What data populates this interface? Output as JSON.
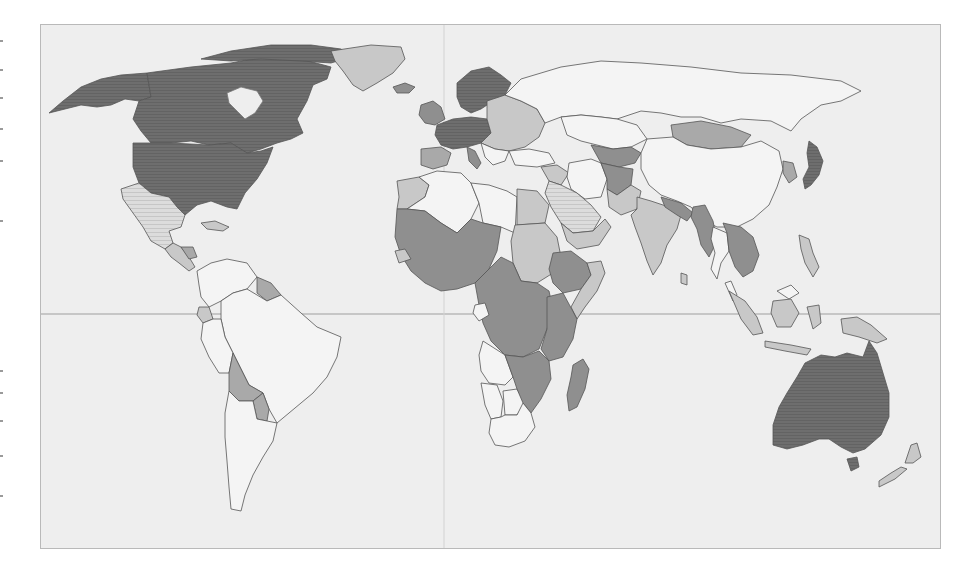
{
  "map": {
    "type": "choropleth",
    "projection": "world",
    "color_scheme": "grayscale",
    "background_ocean": "#eeeeee",
    "frame_border": "#b9b9b9",
    "border_color": "#555555",
    "graticule": {
      "equator": true,
      "prime_meridian": true,
      "line_color": "#9e9e9e"
    },
    "classes": [
      {
        "id": "c1",
        "fill": "#6e6e6e",
        "pattern": "fine-stripes",
        "description": "darkest"
      },
      {
        "id": "c2",
        "fill": "#8f8f8f",
        "pattern": "solid",
        "description": "dark"
      },
      {
        "id": "c3",
        "fill": "#a9a9a9",
        "pattern": "solid",
        "description": "medium"
      },
      {
        "id": "c4",
        "fill": "#c8c8c8",
        "pattern": "solid",
        "description": "light"
      },
      {
        "id": "c5",
        "fill": "#d9d9d9",
        "pattern": "hatched",
        "description": "light hatched"
      },
      {
        "id": "c6",
        "fill": "#f4f4f4",
        "pattern": "solid",
        "description": "lightest"
      }
    ],
    "regions": [
      {
        "name": "Canada",
        "class": "c1"
      },
      {
        "name": "United States",
        "class": "c1"
      },
      {
        "name": "Alaska",
        "class": "c1"
      },
      {
        "name": "Greenland",
        "class": "c4"
      },
      {
        "name": "Iceland",
        "class": "c2"
      },
      {
        "name": "Mexico",
        "class": "c5"
      },
      {
        "name": "Central America",
        "class": "c4"
      },
      {
        "name": "Honduras/Nicaragua",
        "class": "c3"
      },
      {
        "name": "Cuba/Caribbean",
        "class": "c4"
      },
      {
        "name": "Colombia",
        "class": "c6"
      },
      {
        "name": "Venezuela",
        "class": "c6"
      },
      {
        "name": "Guianas",
        "class": "c3"
      },
      {
        "name": "Ecuador",
        "class": "c4"
      },
      {
        "name": "Peru",
        "class": "c6"
      },
      {
        "name": "Brazil",
        "class": "c6"
      },
      {
        "name": "Bolivia",
        "class": "c3"
      },
      {
        "name": "Paraguay",
        "class": "c3"
      },
      {
        "name": "Chile",
        "class": "c6"
      },
      {
        "name": "Argentina",
        "class": "c6"
      },
      {
        "name": "Uruguay",
        "class": "c6"
      },
      {
        "name": "Western Europe",
        "class": "c1"
      },
      {
        "name": "Scandinavia",
        "class": "c1"
      },
      {
        "name": "United Kingdom/Ireland",
        "class": "c2"
      },
      {
        "name": "Iberia",
        "class": "c3"
      },
      {
        "name": "Italy",
        "class": "c2"
      },
      {
        "name": "Eastern Europe",
        "class": "c4"
      },
      {
        "name": "Russia",
        "class": "c6"
      },
      {
        "name": "Kazakhstan",
        "class": "c6"
      },
      {
        "name": "Central Asia",
        "class": "c2"
      },
      {
        "name": "Mongolia",
        "class": "c3"
      },
      {
        "name": "China",
        "class": "c6"
      },
      {
        "name": "Korea",
        "class": "c3"
      },
      {
        "name": "Japan",
        "class": "c1"
      },
      {
        "name": "Turkey",
        "class": "c6"
      },
      {
        "name": "Iran",
        "class": "c6"
      },
      {
        "name": "Afghanistan",
        "class": "c2"
      },
      {
        "name": "Pakistan",
        "class": "c4"
      },
      {
        "name": "India",
        "class": "c4"
      },
      {
        "name": "Nepal/Bangladesh",
        "class": "c2"
      },
      {
        "name": "Myanmar",
        "class": "c2"
      },
      {
        "name": "Thailand",
        "class": "c6"
      },
      {
        "name": "Laos/Cambodia/Vietnam",
        "class": "c2"
      },
      {
        "name": "Saudi Arabia",
        "class": "c5"
      },
      {
        "name": "Yemen/Oman",
        "class": "c4"
      },
      {
        "name": "Egypt",
        "class": "c4"
      },
      {
        "name": "Libya",
        "class": "c6"
      },
      {
        "name": "Algeria",
        "class": "c6"
      },
      {
        "name": "Morocco",
        "class": "c4"
      },
      {
        "name": "West Africa",
        "class": "c2"
      },
      {
        "name": "Sahel",
        "class": "c2"
      },
      {
        "name": "Sudan",
        "class": "c4"
      },
      {
        "name": "Ethiopia",
        "class": "c2"
      },
      {
        "name": "Somalia",
        "class": "c4"
      },
      {
        "name": "Central Africa",
        "class": "c2"
      },
      {
        "name": "Gabon",
        "class": "c6"
      },
      {
        "name": "East Africa",
        "class": "c2"
      },
      {
        "name": "Angola",
        "class": "c6"
      },
      {
        "name": "Namibia",
        "class": "c6"
      },
      {
        "name": "Botswana",
        "class": "c6"
      },
      {
        "name": "Zambia/Zimbabwe/Mozambique",
        "class": "c2"
      },
      {
        "name": "South Africa",
        "class": "c6"
      },
      {
        "name": "Madagascar",
        "class": "c2"
      },
      {
        "name": "Indonesia",
        "class": "c4"
      },
      {
        "name": "Malaysia",
        "class": "c6"
      },
      {
        "name": "Philippines",
        "class": "c4"
      },
      {
        "name": "Papua New Guinea",
        "class": "c4"
      },
      {
        "name": "Australia",
        "class": "c1"
      },
      {
        "name": "New Zealand",
        "class": "c4"
      }
    ]
  }
}
